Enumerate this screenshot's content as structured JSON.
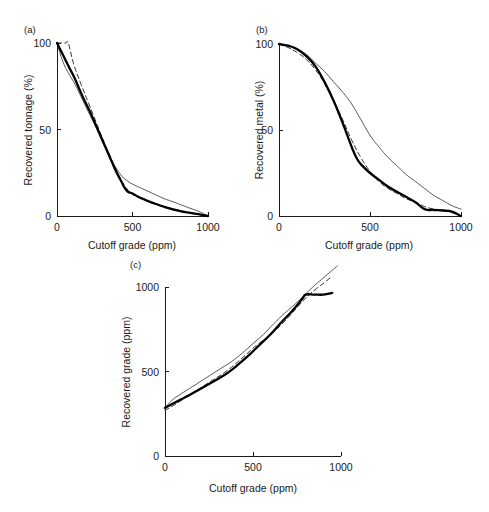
{
  "figure": {
    "panels": [
      {
        "id": "a",
        "label": "(a)",
        "chart_data": {
          "type": "line",
          "title": "",
          "xlabel": "Cutoff grade (ppm)",
          "ylabel": "Recovered tonnage (%)",
          "xlim": [
            0,
            1000
          ],
          "ylim": [
            0,
            100
          ],
          "xticks": [
            0,
            500,
            1000
          ],
          "xtick_labels": [
            "0",
            "500",
            "1000"
          ],
          "yticks": [
            0,
            50,
            100
          ],
          "ytick_labels": [
            "0",
            "50",
            "100"
          ],
          "grid": false,
          "legend": "none",
          "series": [
            {
              "name": "thick-solid",
              "style": "thick-solid",
              "x": [
                0,
                40,
                80,
                120,
                170,
                220,
                270,
                310,
                350,
                390,
                420,
                450,
                470,
                500,
                540,
                580,
                620,
                670,
                720,
                780,
                840,
                900,
                950,
                1000
              ],
              "y": [
                100,
                93,
                86,
                79,
                69,
                60,
                50,
                42,
                34,
                26,
                21,
                16,
                14,
                13,
                11,
                9.5,
                8,
                6.5,
                5,
                3.5,
                2.4,
                1.5,
                0.8,
                0
              ]
            },
            {
              "name": "thin-solid",
              "style": "thin-solid",
              "x": [
                0,
                40,
                80,
                120,
                170,
                220,
                270,
                310,
                350,
                390,
                430,
                470,
                510,
                560,
                610,
                660,
                710,
                760,
                820,
                880,
                930,
                1000
              ],
              "y": [
                100,
                89,
                82,
                76,
                67,
                58,
                49,
                41,
                34,
                28,
                23,
                20,
                18,
                16,
                14,
                12,
                10,
                8.5,
                6.5,
                4.5,
                3,
                0
              ]
            },
            {
              "name": "dashed",
              "style": "dashed",
              "x": [
                0,
                30,
                60,
                75,
                110,
                160,
                210,
                260,
                310,
                350,
                390,
                430,
                470,
                510,
                560,
                610,
                670,
                730,
                800,
                870,
                930,
                1000
              ],
              "y": [
                100,
                100,
                100,
                100,
                88,
                76,
                65,
                54,
                43,
                35,
                27,
                20,
                15,
                12,
                10,
                8,
                6.5,
                5,
                3.5,
                2.2,
                1.2,
                0
              ]
            }
          ]
        }
      },
      {
        "id": "b",
        "label": "(b)",
        "chart_data": {
          "type": "line",
          "title": "",
          "xlabel": "Cutoff grade (ppm)",
          "ylabel": "Recovered metal (%)",
          "xlim": [
            0,
            1000
          ],
          "ylim": [
            0,
            100
          ],
          "xticks": [
            0,
            500,
            1000
          ],
          "xtick_labels": [
            "0",
            "500",
            "1000"
          ],
          "yticks": [
            0,
            50,
            100
          ],
          "ytick_labels": [
            "0",
            "50",
            "100"
          ],
          "grid": false,
          "legend": "none",
          "series": [
            {
              "name": "thick-solid",
              "style": "thick-solid",
              "x": [
                0,
                50,
                100,
                150,
                200,
                250,
                300,
                350,
                400,
                430,
                460,
                500,
                550,
                600,
                650,
                700,
                750,
                800,
                850,
                900,
                950,
                1000
              ],
              "y": [
                100,
                99,
                97,
                93,
                87,
                78,
                67,
                54,
                40,
                33,
                29,
                25,
                21,
                17,
                14,
                11,
                8,
                4,
                3.5,
                3.2,
                2.5,
                0
              ]
            },
            {
              "name": "thin-solid",
              "style": "thin-solid",
              "x": [
                0,
                50,
                100,
                150,
                200,
                250,
                300,
                350,
                400,
                450,
                500,
                550,
                600,
                650,
                700,
                750,
                800,
                850,
                900,
                950,
                1000
              ],
              "y": [
                100,
                99,
                97,
                94,
                89,
                84,
                78,
                72,
                65,
                56,
                47,
                40,
                34,
                29,
                24,
                20,
                16,
                12,
                9,
                6,
                4
              ]
            },
            {
              "name": "dashed",
              "style": "dashed",
              "x": [
                0,
                50,
                100,
                150,
                200,
                250,
                300,
                350,
                400,
                450,
                500,
                550,
                600,
                650,
                700,
                750,
                800,
                850,
                900,
                950,
                1000
              ],
              "y": [
                100,
                98,
                95,
                91,
                85,
                77,
                67,
                56,
                44,
                34,
                26,
                20,
                16,
                13,
                10,
                8,
                5.5,
                4,
                3,
                2,
                0
              ]
            }
          ]
        }
      },
      {
        "id": "c",
        "label": "(c)",
        "chart_data": {
          "type": "line",
          "title": "",
          "xlabel": "Cutoff grade (ppm)",
          "ylabel": "Recovered grade (ppm)",
          "xlim": [
            0,
            1000
          ],
          "ylim": [
            0,
            1000
          ],
          "xticks": [
            0,
            500,
            1000
          ],
          "xtick_labels": [
            "0",
            "500",
            "1000"
          ],
          "yticks": [
            0,
            500,
            1000
          ],
          "ytick_labels": [
            "0",
            "500",
            "1000"
          ],
          "grid": false,
          "legend": "none",
          "series": [
            {
              "name": "thick-solid",
              "style": "thick-solid",
              "x": [
                0,
                60,
                120,
                180,
                240,
                300,
                360,
                420,
                480,
                540,
                600,
                660,
                720,
                780,
                800,
                850,
                900,
                950
              ],
              "y": [
                285,
                318,
                350,
                385,
                420,
                455,
                495,
                545,
                600,
                660,
                720,
                790,
                855,
                930,
                955,
                955,
                955,
                965
              ]
            },
            {
              "name": "thin-solid",
              "style": "thin-solid",
              "x": [
                0,
                40,
                80,
                140,
                200,
                260,
                320,
                380,
                440,
                500,
                560,
                620,
                680,
                740,
                790,
                840,
                890,
                940,
                980
              ],
              "y": [
                285,
                330,
                360,
                400,
                440,
                480,
                520,
                560,
                610,
                665,
                720,
                785,
                845,
                900,
                950,
                1000,
                1045,
                1090,
                1125
              ]
            },
            {
              "name": "dashed",
              "style": "dashed",
              "x": [
                0,
                50,
                100,
                160,
                220,
                280,
                340,
                400,
                460,
                520,
                580,
                640,
                700,
                760,
                810,
                860,
                910,
                950
              ],
              "y": [
                270,
                300,
                335,
                375,
                415,
                455,
                495,
                545,
                600,
                655,
                700,
                755,
                820,
                890,
                945,
                990,
                1030,
                1065
              ]
            }
          ]
        }
      }
    ]
  }
}
